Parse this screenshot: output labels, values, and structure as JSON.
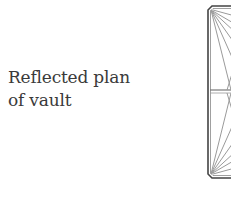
{
  "caption": {
    "line1": "Reflected plan",
    "line2": "of vault"
  },
  "drawing": {
    "subject": "reflected-plan-of-vault",
    "stroke_color": "#555555",
    "rib_color": "#9a9a9a"
  }
}
